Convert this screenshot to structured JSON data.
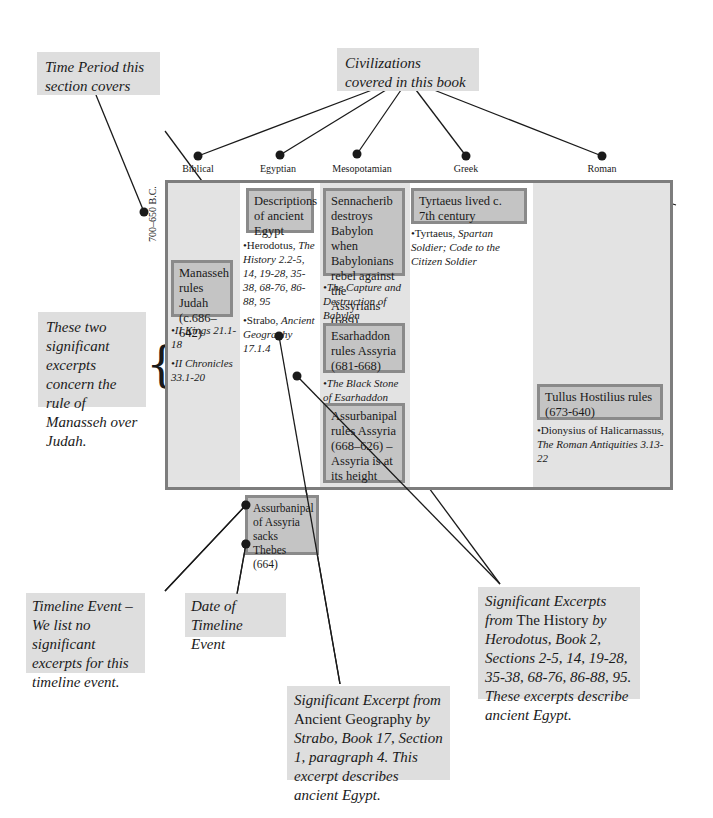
{
  "callouts": {
    "time_period": "Time Period this section covers",
    "civilizations": "Civilizations covered in this book",
    "manasseh_excerpts": "These two significant excerpts concern the rule of Manasseh over Judah.",
    "timeline_event": "Timeline Event – We list no significant excerpts for this timeline event.",
    "date_of_event": "Date of Timeline Event",
    "herodotus_note": {
      "prefix": "Significant Excerpts from",
      "title": "The History",
      "rest": "by Herodotus, Book 2, Sections 2-5, 14, 19-28, 35-38, 68-76, 86-88, 95. These excerpts describe ancient Egypt."
    },
    "strabo_note": {
      "prefix": "Significant Excerpt from",
      "title": "Ancient Geography",
      "rest": "by Strabo, Book 17, Section 1, paragraph 4. This excerpt describes ancient Egypt."
    }
  },
  "time_period_label": "700–650 B.C.",
  "civilizations": [
    {
      "name": "Biblical"
    },
    {
      "name": "Egyptian"
    },
    {
      "name": "Mesopotamian"
    },
    {
      "name": "Greek"
    },
    {
      "name": "Roman"
    }
  ],
  "columns": {
    "biblical": {
      "events": [
        {
          "text": "Manasseh rules Judah (c.686–642)"
        }
      ],
      "refs": [
        {
          "text": "•II Kings 21.1-18"
        },
        {
          "text": "•II Chronicles 33.1-20"
        }
      ]
    },
    "egyptian": {
      "events": [
        {
          "text": "Descriptions of ancient Egypt"
        },
        {
          "text": "Assurbanipal of Assyria sacks Thebes (664)"
        }
      ],
      "refs": [
        {
          "author": "•Herodotus, ",
          "work": "The History 2.2-5, 14, 19-28, 35-38, 68-76, 86-88, 95"
        },
        {
          "author": "•Strabo, ",
          "work": "Ancient Geography 17.1.4"
        }
      ]
    },
    "mesopotamian": {
      "events": [
        {
          "text": "Sennacherib destroys Babylon when Babylonians rebel against the Assyrians (689)"
        },
        {
          "text": "Esarhaddon rules Assyria (681-668)"
        },
        {
          "text": "Assurbanipal rules Assyria (668–626) – Assyria is at its height"
        }
      ],
      "refs": [
        {
          "text": "•The Capture and Destruction of Babylon"
        },
        {
          "text": "•The Black Stone of Esarhaddon"
        }
      ]
    },
    "greek": {
      "events": [
        {
          "text": "Tyrtaeus lived c. 7th century"
        }
      ],
      "refs": [
        {
          "author": "•Tyrtaeus, ",
          "work": "Spartan Soldier; Code to the Citizen Soldier"
        }
      ]
    },
    "roman": {
      "events": [
        {
          "text": "Tullus Hostilius rules (673-640)"
        }
      ],
      "refs": [
        {
          "author": "•Dionysius of Halicarnassus, ",
          "work": "The Roman Antiquities 3.13-22"
        }
      ]
    }
  }
}
